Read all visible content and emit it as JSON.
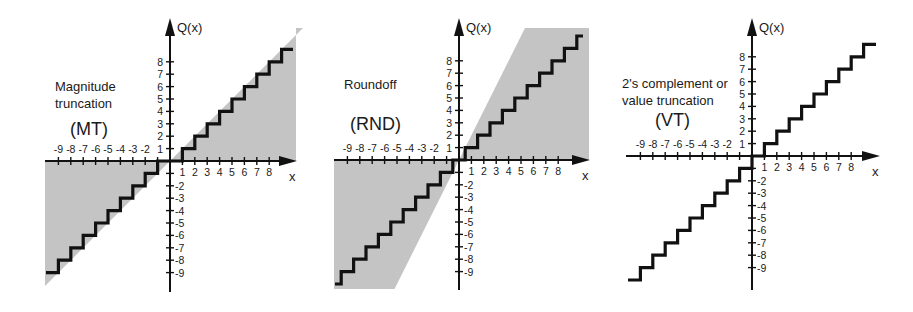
{
  "chart_data": [
    {
      "type": "line",
      "id": "mt",
      "title": "Magnitude truncation",
      "abbrev": "(MT)",
      "title_lines": [
        "Magnitude",
        "truncation"
      ],
      "xlabel": "x",
      "ylabel": "Q(x)",
      "x_ticks": [
        -9,
        -8,
        -7,
        -6,
        -5,
        -4,
        -3,
        -2,
        1,
        2,
        3,
        4,
        5,
        6,
        7,
        8
      ],
      "y_ticks": [
        1,
        2,
        3,
        4,
        5,
        6,
        7,
        8,
        -2,
        -3,
        -4,
        -5,
        -6,
        -7,
        -8,
        -9
      ],
      "xlim": [
        -10,
        10
      ],
      "ylim": [
        -10,
        10
      ],
      "grid": false,
      "function": "Q(x) = sign(x) * floor(|x|)",
      "shaded_region": "between Q(x) and the line y = x (error region, toward zero)",
      "series": [
        {
          "name": "Q(x)",
          "x": [
            -10,
            -9,
            -9,
            -8,
            -8,
            -7,
            -7,
            -6,
            -6,
            -5,
            -5,
            -4,
            -4,
            -3,
            -3,
            -2,
            -2,
            -1,
            -1,
            1,
            1,
            2,
            2,
            3,
            3,
            4,
            4,
            5,
            5,
            6,
            6,
            7,
            7,
            8,
            8,
            9,
            9,
            10
          ],
          "y": [
            -9,
            -9,
            -8,
            -8,
            -7,
            -7,
            -6,
            -6,
            -5,
            -5,
            -4,
            -4,
            -3,
            -3,
            -2,
            -2,
            -1,
            -1,
            0,
            0,
            1,
            1,
            2,
            2,
            3,
            3,
            4,
            4,
            5,
            5,
            6,
            6,
            7,
            7,
            8,
            8,
            9,
            9
          ]
        }
      ]
    },
    {
      "type": "line",
      "id": "rnd",
      "title": "Roundoff",
      "abbrev": "(RND)",
      "title_lines": [
        "Roundoff"
      ],
      "xlabel": "x",
      "ylabel": "Q(x)",
      "x_ticks": [
        -9,
        -8,
        -7,
        -6,
        -5,
        -4,
        -3,
        -2,
        1,
        2,
        3,
        4,
        5,
        6,
        7,
        8
      ],
      "y_ticks": [
        1,
        2,
        3,
        4,
        5,
        6,
        7,
        8,
        -2,
        -3,
        -4,
        -5,
        -6,
        -7,
        -8,
        -9
      ],
      "xlim": [
        -10,
        10
      ],
      "ylim": [
        -10,
        10
      ],
      "grid": false,
      "function": "Q(x) = round(x)",
      "shaded_region": "parallelogram band around Q(x) bounded by slope-2 lines through origin",
      "series": [
        {
          "name": "Q(x)",
          "x": [
            -10,
            -9.5,
            -9.5,
            -8.5,
            -8.5,
            -7.5,
            -7.5,
            -6.5,
            -6.5,
            -5.5,
            -5.5,
            -4.5,
            -4.5,
            -3.5,
            -3.5,
            -2.5,
            -2.5,
            -1.5,
            -1.5,
            -0.5,
            -0.5,
            0.5,
            0.5,
            1.5,
            1.5,
            2.5,
            2.5,
            3.5,
            3.5,
            4.5,
            4.5,
            5.5,
            5.5,
            6.5,
            6.5,
            7.5,
            7.5,
            8.5,
            8.5,
            9.5,
            9.5,
            10
          ],
          "y": [
            -10,
            -10,
            -9,
            -9,
            -8,
            -8,
            -7,
            -7,
            -6,
            -6,
            -5,
            -5,
            -4,
            -4,
            -3,
            -3,
            -2,
            -2,
            -1,
            -1,
            0,
            0,
            1,
            1,
            2,
            2,
            3,
            3,
            4,
            4,
            5,
            5,
            6,
            6,
            7,
            7,
            8,
            8,
            9,
            9,
            10,
            10
          ]
        }
      ]
    },
    {
      "type": "line",
      "id": "vt",
      "title": "2's complement or value truncation",
      "abbrev": "(VT)",
      "title_lines": [
        "2's complement or",
        "value truncation"
      ],
      "xlabel": "x",
      "ylabel": "Q(x)",
      "x_ticks": [
        -9,
        -8,
        -7,
        -6,
        -5,
        -4,
        -3,
        -2,
        1,
        2,
        3,
        4,
        5,
        6,
        7,
        8
      ],
      "y_ticks": [
        1,
        2,
        3,
        4,
        5,
        6,
        7,
        8,
        -2,
        -3,
        -4,
        -5,
        -6,
        -7,
        -8,
        -9
      ],
      "xlim": [
        -10,
        10
      ],
      "ylim": [
        -10,
        10
      ],
      "grid": false,
      "function": "Q(x) = floor(x)",
      "shaded_region": "none",
      "series": [
        {
          "name": "Q(x)",
          "x": [
            -10,
            -9,
            -9,
            -8,
            -8,
            -7,
            -7,
            -6,
            -6,
            -5,
            -5,
            -4,
            -4,
            -3,
            -3,
            -2,
            -2,
            -1,
            -1,
            0,
            0,
            1,
            1,
            2,
            2,
            3,
            3,
            4,
            4,
            5,
            5,
            6,
            6,
            7,
            7,
            8,
            8,
            9,
            9,
            10
          ],
          "y": [
            -10,
            -10,
            -9,
            -9,
            -8,
            -8,
            -7,
            -7,
            -6,
            -6,
            -5,
            -5,
            -4,
            -4,
            -3,
            -3,
            -2,
            -2,
            -1,
            -1,
            0,
            0,
            1,
            1,
            2,
            2,
            3,
            3,
            4,
            4,
            5,
            5,
            6,
            6,
            7,
            7,
            8,
            8,
            9,
            9
          ]
        }
      ]
    }
  ],
  "colors": {
    "axis": "#111111",
    "step": "#111111",
    "shade": "#c4c4c4",
    "text": "#1a1a1a"
  }
}
